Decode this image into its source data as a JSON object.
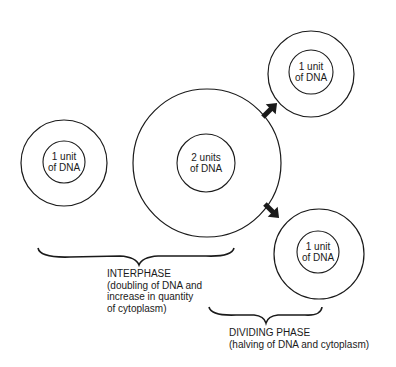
{
  "cells": {
    "interphase_cell": {
      "line1": "1 unit",
      "line2": "of DNA"
    },
    "grown_cell": {
      "line1": "2 units",
      "line2": "of DNA"
    },
    "daughter_top": {
      "line1": "1 unit",
      "line2": "of DNA"
    },
    "daughter_bottom": {
      "line1": "1 unit",
      "line2": "of DNA"
    }
  },
  "captions": {
    "interphase": {
      "title": "INTERPHASE",
      "line1": "(doubling of DNA and",
      "line2": "increase in quantity",
      "line3": "of cytoplasm)"
    },
    "dividing": {
      "title": "DIVIDING PHASE",
      "line1": "(halving of DNA and cytoplasm)"
    }
  },
  "colors": {
    "stroke": "#1a1a1a",
    "background": "#ffffff"
  }
}
